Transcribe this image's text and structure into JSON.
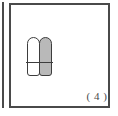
{
  "figure": {
    "caption": "( 4 )",
    "panel_border_color": "#4a4a4a",
    "background_color": "#ffffff",
    "neighbor_panel_edge_visible": true,
    "diagram": {
      "name": "two-capsule-cross-section",
      "outline_color": "#3d3d3d",
      "elements": [
        {
          "name": "left-capsule",
          "fill_color": "#ffffff",
          "shape": "capsule"
        },
        {
          "name": "right-capsule",
          "fill_color": "#b9b9b9",
          "shape": "capsule"
        },
        {
          "name": "horizontal-divider",
          "color": "#3d3d3d",
          "shape": "line"
        }
      ]
    }
  }
}
